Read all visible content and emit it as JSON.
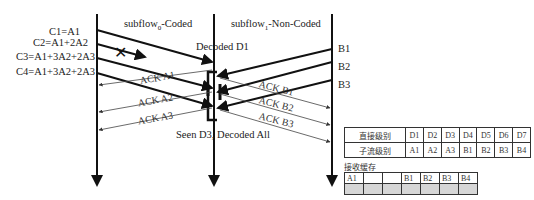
{
  "flows": {
    "subflow0": {
      "name": "subflow",
      "subscript": "0",
      "suffix": "-Coded"
    },
    "subflow1": {
      "name": "subflow",
      "subscript": "1",
      "suffix": "-Non-Coded"
    }
  },
  "coded_packets": [
    {
      "label": "C1=A1"
    },
    {
      "label": "C2=A1+2A2",
      "lost": true
    },
    {
      "label": "C3=A1+3A2+2A3"
    },
    {
      "label": "C4=A1+3A2+2A3"
    }
  ],
  "uncoded_packets": [
    {
      "label": "B1"
    },
    {
      "label": "B2"
    },
    {
      "label": "B3"
    }
  ],
  "acks_subflow0": [
    "ACK A1",
    "ACK A2",
    "ACK A3"
  ],
  "acks_subflow1": [
    "ACK B1",
    "ACK B2",
    "ACK B3"
  ],
  "annotations": {
    "decoded_d1": "Decoded D1",
    "seen_d3": "Seen D3, Decoded All",
    "loss_marker": "✕"
  },
  "level_table": {
    "rows": [
      {
        "header": "直接级别",
        "cells": [
          "D1",
          "D2",
          "D3",
          "D4",
          "D5",
          "D6",
          "D7"
        ]
      },
      {
        "header": "子流级别",
        "cells": [
          "A1",
          "A2",
          "A3",
          "B1",
          "B2",
          "B3",
          "B4"
        ]
      }
    ]
  },
  "receive_buffer": {
    "title": "接收缓存",
    "slots": [
      "A1",
      "",
      "",
      "B1",
      "B2",
      "B3",
      "B4"
    ]
  }
}
